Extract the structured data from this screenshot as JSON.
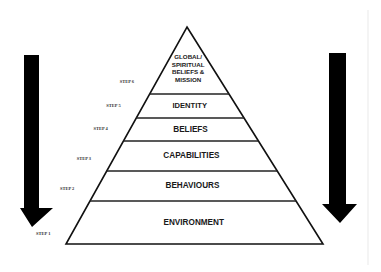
{
  "diagram": {
    "type": "pyramid",
    "title": "",
    "tiers_top_to_bottom": [
      {
        "step": "STEP 6",
        "label_lines": [
          "GLOBAL/",
          "SPIRITUAL",
          "BELIEFS &",
          "MISSION"
        ]
      },
      {
        "step": "STEP 5",
        "label_lines": [
          "IDENTITY"
        ]
      },
      {
        "step": "STEP 4",
        "label_lines": [
          "BELIEFS"
        ]
      },
      {
        "step": "STEP 3",
        "label_lines": [
          "CAPABILITIES"
        ]
      },
      {
        "step": "STEP 2",
        "label_lines": [
          "BEHAVIOURS"
        ]
      },
      {
        "step": "STEP 1",
        "label_lines": [
          "ENVIRONMENT"
        ]
      }
    ],
    "arrows": [
      {
        "side": "left",
        "direction": "down",
        "icon": "arrow-down-icon"
      },
      {
        "side": "right",
        "direction": "down",
        "icon": "arrow-down-icon"
      }
    ],
    "colors": {
      "background": "#ffffff",
      "outline": "#111111",
      "arrow": "#000000",
      "text": "#1a1a1a"
    }
  }
}
